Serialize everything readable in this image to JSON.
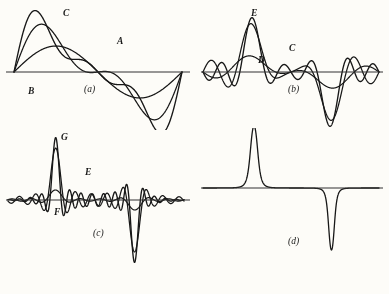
{
  "figure": {
    "background_color": "#fdfdfc",
    "ink_color": "#171717",
    "axis_color": "#333333",
    "width": 389,
    "height": 294
  },
  "panels": [
    {
      "id": "a",
      "caption": "(a)",
      "labels": [
        {
          "text": "C",
          "x": 63,
          "y": 8
        },
        {
          "text": "A",
          "x": 117,
          "y": 36
        },
        {
          "text": "B",
          "x": 28,
          "y": 86
        }
      ],
      "caption_pos": {
        "x": 88,
        "y": 88
      },
      "description": "Three superimposed sinusoidal partial sums, one positive lobe then one negative lobe"
    },
    {
      "id": "b",
      "caption": "(b)",
      "labels": [
        {
          "text": "E",
          "x": 251,
          "y": 8
        },
        {
          "text": "C",
          "x": 289,
          "y": 43
        },
        {
          "text": "D",
          "x": 258,
          "y": 55
        }
      ],
      "caption_pos": {
        "x": 292,
        "y": 88
      },
      "description": "Narrower taller peak with ripples; positive peak then negative peak"
    },
    {
      "id": "c",
      "caption": "(c)",
      "labels": [
        {
          "text": "G",
          "x": 61,
          "y": 134
        },
        {
          "text": "E",
          "x": 85,
          "y": 168
        },
        {
          "text": "F",
          "x": 54,
          "y": 208
        }
      ],
      "caption_pos": {
        "x": 97,
        "y": 230
      },
      "description": "Still narrower and taller peak with many fine ripples along the baseline"
    },
    {
      "id": "d",
      "caption": "(d)",
      "labels": [],
      "caption_pos": {
        "x": 292,
        "y": 240
      },
      "description": "Limiting case: single sharp positive impulse and single sharp negative impulse, no ripples"
    }
  ],
  "chart_data": {
    "type": "line",
    "title": "",
    "xlabel": "",
    "ylabel": "",
    "grid": false,
    "legend": "none",
    "note": "Successive Fourier partial sums converging to an impulse pair; each panel shows superimposed curves of increasing order",
    "panels": [
      {
        "id": "a",
        "caption": "(a)",
        "baseline_y": 72,
        "x_range": [
          14,
          180
        ],
        "series": [
          {
            "name": "A",
            "harmonics": 1,
            "peak": 26,
            "trough": -26,
            "label": "A"
          },
          {
            "name": "B",
            "harmonics": 2,
            "peak": 44,
            "trough": -44,
            "label": "B"
          },
          {
            "name": "C",
            "harmonics": 3,
            "peak": 52,
            "trough": -52,
            "label": "C"
          }
        ]
      },
      {
        "id": "b",
        "caption": "(b)",
        "baseline_y": 72,
        "x_range": [
          208,
          376
        ],
        "series": [
          {
            "name": "D",
            "harmonics": 3,
            "peak": 14,
            "trough": -14,
            "label": "D"
          },
          {
            "name": "C",
            "harmonics": 5,
            "peak": 50,
            "trough": -52,
            "label": "C"
          },
          {
            "name": "E",
            "harmonics": 7,
            "peak": 58,
            "trough": -58,
            "label": "E"
          }
        ]
      },
      {
        "id": "c",
        "caption": "(c)",
        "baseline_y": 200,
        "x_range": [
          14,
          180
        ],
        "series": [
          {
            "name": "F",
            "harmonics": 7,
            "peak": 10,
            "trough": -10,
            "label": "F"
          },
          {
            "name": "E",
            "harmonics": 11,
            "peak": 54,
            "trough": -56,
            "label": "E"
          },
          {
            "name": "G",
            "harmonics": 15,
            "peak": 62,
            "trough": -62,
            "label": "G"
          }
        ]
      },
      {
        "id": "d",
        "caption": "(d)",
        "baseline_y": 188,
        "x_range": [
          208,
          376
        ],
        "series": [
          {
            "name": "limit",
            "harmonics": "infinite",
            "peak": 90,
            "trough": -90,
            "label": ""
          }
        ]
      }
    ]
  }
}
